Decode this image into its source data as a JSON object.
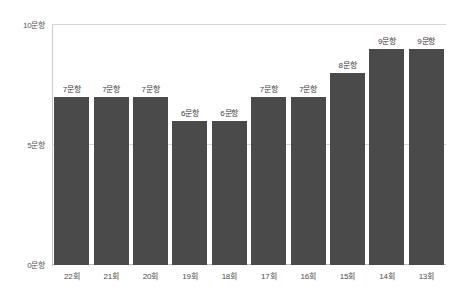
{
  "chart_data": {
    "type": "bar",
    "title": "",
    "subtitle": "",
    "xlabel": "",
    "ylabel": "",
    "categories": [
      "22회",
      "21회",
      "20회",
      "19회",
      "18회",
      "17회",
      "16회",
      "15회",
      "14회",
      "13회"
    ],
    "values": [
      7,
      7,
      7,
      6,
      6,
      7,
      7,
      8,
      9,
      9
    ],
    "data_labels": [
      "7문항",
      "7문항",
      "7문항",
      "6문항",
      "6문항",
      "7문항",
      "7문항",
      "8문항",
      "9문항",
      "9문항"
    ],
    "ylim": [
      0,
      10
    ],
    "yticks": [
      0,
      5,
      10
    ],
    "ytick_labels": [
      "0문항",
      "5문항",
      "10문항"
    ],
    "grid": true,
    "legend": false,
    "legend_position": "none",
    "series": [
      {
        "name": "문항 수",
        "values": [
          7,
          7,
          7,
          6,
          6,
          7,
          7,
          8,
          9,
          9
        ],
        "color": "#4a4a4a"
      }
    ]
  },
  "colors": {
    "bar": "#4a4a4a",
    "gridline": "#d6d6d6",
    "axis": "#c9c9c9",
    "background": "#ffffff",
    "label_text": "#3a3a3a",
    "tick_text": "#555555"
  }
}
